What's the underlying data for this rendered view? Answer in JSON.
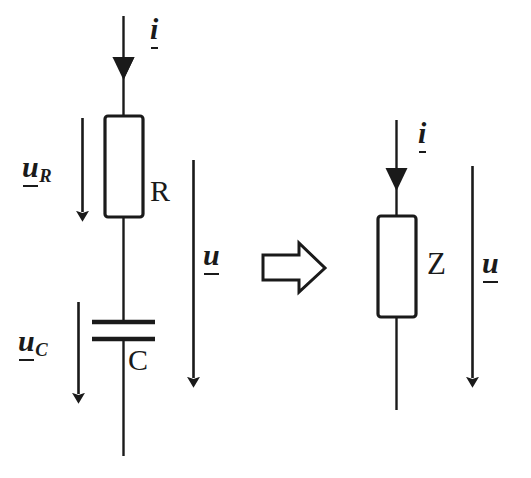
{
  "diagram": {
    "ink_color": "#1a1a1a",
    "background_color": "#ffffff",
    "equivalence_symbol": "implication-arrow-right",
    "left_circuit": {
      "name": "series-rc-circuit",
      "current_label": "i",
      "total_voltage_label": "u",
      "elements": [
        {
          "id": "resistor",
          "component_label": "R",
          "voltage_label_base": "u",
          "voltage_label_sub": "R"
        },
        {
          "id": "capacitor",
          "component_label": "C",
          "voltage_label_base": "u",
          "voltage_label_sub": "C"
        }
      ]
    },
    "right_circuit": {
      "name": "equivalent-impedance-circuit",
      "current_label": "i",
      "total_voltage_label": "u",
      "elements": [
        {
          "id": "impedance",
          "component_label": "Z"
        }
      ]
    }
  }
}
